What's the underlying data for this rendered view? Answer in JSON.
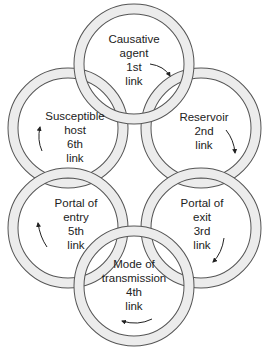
{
  "diagram": {
    "links": [
      {
        "id": "link-1",
        "name_lines": [
          "Causative",
          "agent"
        ],
        "order": "1st",
        "suffix": "link",
        "cx": 134,
        "cy": 64
      },
      {
        "id": "link-2",
        "name_lines": [
          "Reservoir"
        ],
        "order": "2nd",
        "suffix": "link",
        "cx": 201,
        "cy": 128
      },
      {
        "id": "link-3",
        "name_lines": [
          "Portal of",
          "exit"
        ],
        "order": "3rd",
        "suffix": "link",
        "cx": 201,
        "cy": 228
      },
      {
        "id": "link-4",
        "name_lines": [
          "Mode of",
          "transmission"
        ],
        "order": "4th",
        "suffix": "link",
        "cx": 134,
        "cy": 286
      },
      {
        "id": "link-5",
        "name_lines": [
          "Portal of",
          "entry"
        ],
        "order": "5th",
        "suffix": "link",
        "cx": 68,
        "cy": 228
      },
      {
        "id": "link-6",
        "name_lines": [
          "Susceptible",
          "host"
        ],
        "order": "6th",
        "suffix": "link",
        "cx": 68,
        "cy": 128
      }
    ],
    "colors": {
      "ring_fill": "#e8e8e8",
      "ring_stroke": "#555555",
      "text": "#222222"
    }
  }
}
